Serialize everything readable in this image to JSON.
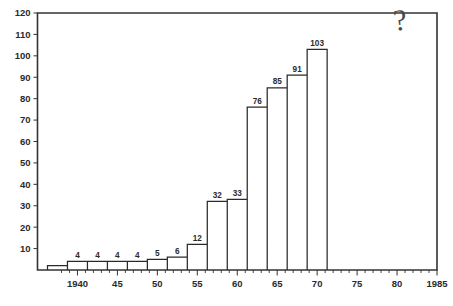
{
  "chart_data": {
    "type": "bar",
    "title": "",
    "subtitle": "",
    "xlabel": "",
    "ylabel": "",
    "xlim": [
      1935,
      1985
    ],
    "ylim": [
      0,
      120
    ],
    "grid": false,
    "legend": null,
    "y_ticks": [
      0,
      10,
      20,
      30,
      40,
      50,
      60,
      70,
      80,
      90,
      100,
      110,
      120
    ],
    "y_tick_labels": [
      "",
      "10",
      "20",
      "30",
      "40",
      "50",
      "60",
      "70",
      "80",
      "90",
      "100",
      "110",
      "120"
    ],
    "y_tick_step": 10,
    "x_ticks": [
      1940,
      1945,
      1950,
      1955,
      1960,
      1965,
      1970,
      1975,
      1980,
      1985
    ],
    "x_tick_labels": [
      "1940",
      "45",
      "50",
      "55",
      "60",
      "65",
      "70",
      "75",
      "80",
      "1985"
    ],
    "x_minor_tick_step": 1,
    "bar_width_years": 2.5,
    "categories": [
      "1937.5",
      "1940",
      "1942.5",
      "1945",
      "1947.5",
      "1950",
      "1952.5",
      "1955",
      "1957.5",
      "1960",
      "1962.5",
      "1965",
      "1967.5",
      "1970"
    ],
    "x": [
      1937.5,
      1940,
      1942.5,
      1945,
      1947.5,
      1950,
      1952.5,
      1955,
      1957.5,
      1960,
      1962.5,
      1965,
      1967.5,
      1970
    ],
    "values": [
      2,
      4,
      4,
      4,
      4,
      5,
      6,
      12,
      32,
      33,
      76,
      85,
      91,
      103
    ],
    "bar_labels": [
      "",
      "4",
      "4",
      "4",
      "4",
      "5",
      "6",
      "12",
      "32",
      "33",
      "76",
      "85",
      "91",
      "103"
    ],
    "annotations": [
      {
        "text": "?",
        "x": 1980.5,
        "y": 112,
        "style": "handwritten-question-mark"
      }
    ],
    "colors": {
      "bar_stroke": "#2a2a2a",
      "bar_fill": "none",
      "axis": "#333333",
      "text": "#2b2b2b",
      "background": "#ffffff",
      "annotation": "#4a4a4a"
    }
  }
}
